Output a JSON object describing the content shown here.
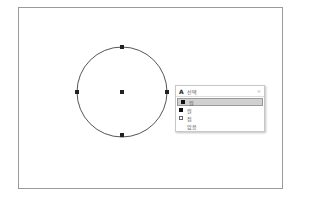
{
  "popup": {
    "title": "선택",
    "title_icon": "A",
    "close_icon": "×",
    "items": [
      {
        "label": "원",
        "icon": "filled-square",
        "selected": true
      },
      {
        "label": "원",
        "icon": "filled-square",
        "selected": false
      },
      {
        "label": "점",
        "icon": "hollow-square",
        "selected": false
      },
      {
        "label": "없음",
        "icon": "none",
        "selected": false
      }
    ]
  },
  "colors": {
    "circle_stroke": "#555555",
    "grip_fill": "#222222",
    "frame_border": "#9a9a9a",
    "selected_item_bg": "#d0d0d0"
  }
}
